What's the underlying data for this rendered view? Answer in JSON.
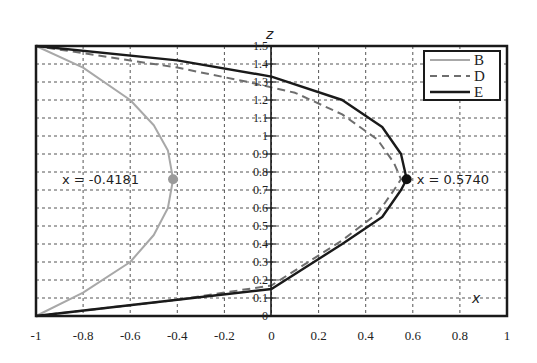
{
  "chart_data": {
    "type": "line",
    "title": "",
    "xlabel": "x",
    "ylabel": "z",
    "xlim": [
      -1,
      1
    ],
    "ylim": [
      0,
      1.5
    ],
    "grid": true,
    "legend_position": "upper right",
    "x_ticks": [
      "-1",
      "-0.8",
      "-0.6",
      "-0.4",
      "-0.2",
      "0",
      "0.2",
      "0.4",
      "0.6",
      "0.8",
      "1"
    ],
    "y_ticks": [
      "0",
      "0.1",
      "0.2",
      "0.3",
      "0.4",
      "0.5",
      "0.6",
      "0.7",
      "0.8",
      "0.9",
      "1",
      "1.1",
      "1.2",
      "1.3",
      "1.4",
      "1.5"
    ],
    "series": [
      {
        "name": "B",
        "style": "solid",
        "color": "#a8a8a8",
        "points": [
          [
            -1,
            0
          ],
          [
            -0.8,
            0.13
          ],
          [
            -0.6,
            0.3
          ],
          [
            -0.5,
            0.45
          ],
          [
            -0.44,
            0.6
          ],
          [
            -0.418,
            0.76
          ],
          [
            -0.44,
            0.92
          ],
          [
            -0.5,
            1.06
          ],
          [
            -0.6,
            1.2
          ],
          [
            -0.8,
            1.38
          ],
          [
            -1,
            1.5
          ]
        ]
      },
      {
        "name": "D",
        "style": "dashed",
        "color": "#6e6e6e",
        "points": [
          [
            -1,
            0
          ],
          [
            -0.4,
            0.09
          ],
          [
            0,
            0.17
          ],
          [
            0.3,
            0.42
          ],
          [
            0.45,
            0.57
          ],
          [
            0.52,
            0.7
          ],
          [
            0.55,
            0.76
          ],
          [
            0.52,
            0.85
          ],
          [
            0.45,
            0.98
          ],
          [
            0.3,
            1.12
          ],
          [
            0.1,
            1.24
          ],
          [
            -0.1,
            1.3
          ],
          [
            -0.4,
            1.38
          ],
          [
            -1,
            1.5
          ]
        ]
      },
      {
        "name": "E",
        "style": "solid",
        "color": "#1a1a1a",
        "points": [
          [
            -1,
            0
          ],
          [
            -0.4,
            0.09
          ],
          [
            0,
            0.15
          ],
          [
            0.3,
            0.4
          ],
          [
            0.47,
            0.55
          ],
          [
            0.55,
            0.7
          ],
          [
            0.574,
            0.76
          ],
          [
            0.55,
            0.9
          ],
          [
            0.47,
            1.05
          ],
          [
            0.3,
            1.2
          ],
          [
            0,
            1.33
          ],
          [
            -0.4,
            1.42
          ],
          [
            -1,
            1.5
          ]
        ]
      }
    ],
    "annotations": [
      {
        "text": "x = -0.4181",
        "point": [
          -0.4181,
          0.76
        ],
        "marker_color": "#9a9a9a",
        "series": "B"
      },
      {
        "text": "x = 0.5740",
        "point": [
          0.574,
          0.76
        ],
        "marker_color": "#111111",
        "series": "E"
      }
    ]
  }
}
